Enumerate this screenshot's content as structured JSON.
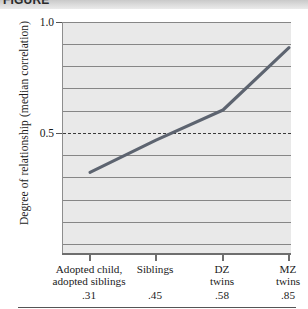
{
  "header": {
    "title": "FIGURE"
  },
  "chart_data": {
    "type": "line",
    "title": "",
    "xlabel": "",
    "ylabel": "Degree of relationship (median correlation)",
    "categories": [
      "Adopted child, adopted siblings",
      "Siblings",
      "DZ twins",
      "MZ twins"
    ],
    "category_lines": [
      [
        "Adopted child,",
        "adopted siblings"
      ],
      [
        "Siblings"
      ],
      [
        "DZ",
        "twins"
      ],
      [
        "MZ",
        "twins"
      ]
    ],
    "values": [
      0.31,
      0.45,
      0.58,
      0.85
    ],
    "value_labels": [
      ".31",
      ".45",
      ".58",
      ".85"
    ],
    "ylim": [
      0.0,
      1.0
    ],
    "ytick_labels": [
      "1.0",
      "0.5"
    ],
    "ytick_values": [
      1.0,
      0.5
    ],
    "gridlines": [
      1.0,
      0.9,
      0.8,
      0.7,
      0.6,
      0.4,
      0.3,
      0.2,
      0.1
    ],
    "grid": true,
    "reference_line": {
      "value": 0.5,
      "style": "dashed"
    },
    "legend": null,
    "legend_position": "none",
    "colors": {
      "line": "#5d6470",
      "plot_background": "#e9e9e9",
      "gridline": "#868686",
      "reference_line": "#3a3a3a",
      "axis": "#6e6e6e",
      "text": "#1a1a1a"
    }
  }
}
